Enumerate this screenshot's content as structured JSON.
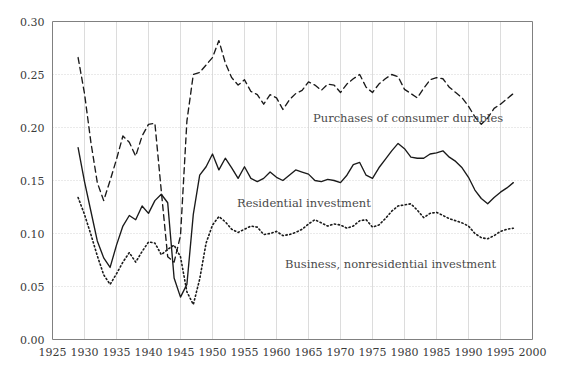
{
  "figure": {
    "background_color": "#ffffff",
    "line_color": "#1a1a1a",
    "grid_color": "#d8d8d8",
    "axis_color": "#808080"
  },
  "axes": {
    "x_tick_labels": [
      "1925",
      "1930",
      "1935",
      "1940",
      "1945",
      "1950",
      "1955",
      "1960",
      "1965",
      "1970",
      "1975",
      "1980",
      "1985",
      "1990",
      "1995",
      "2000"
    ],
    "y_tick_labels": [
      "0.00",
      "0.05",
      "0.10",
      "0.15",
      "0.20",
      "0.25",
      "0.30"
    ]
  },
  "annotations": {
    "durables": "Purchases of consumer durables",
    "residential": "Residential investment",
    "business": "Business, nonresidential investment"
  },
  "chart_data": {
    "type": "line",
    "title": "",
    "xlabel": "",
    "ylabel": "",
    "xlim": [
      1925,
      2000
    ],
    "ylim": [
      0.0,
      0.3
    ],
    "xticks": [
      1925,
      1930,
      1935,
      1940,
      1945,
      1950,
      1955,
      1960,
      1965,
      1970,
      1975,
      1980,
      1985,
      1990,
      1995,
      2000
    ],
    "yticks": [
      0.0,
      0.05,
      0.1,
      0.15,
      0.2,
      0.25,
      0.3
    ],
    "grid": true,
    "legend": "inline-annotations",
    "x": [
      1929,
      1930,
      1931,
      1932,
      1933,
      1934,
      1935,
      1936,
      1937,
      1938,
      1939,
      1940,
      1941,
      1942,
      1943,
      1944,
      1945,
      1946,
      1947,
      1948,
      1949,
      1950,
      1951,
      1952,
      1953,
      1954,
      1955,
      1956,
      1957,
      1958,
      1959,
      1960,
      1961,
      1962,
      1963,
      1964,
      1965,
      1966,
      1967,
      1968,
      1969,
      1970,
      1971,
      1972,
      1973,
      1974,
      1975,
      1976,
      1977,
      1978,
      1979,
      1980,
      1981,
      1982,
      1983,
      1984,
      1985,
      1986,
      1987,
      1988,
      1989,
      1990,
      1991,
      1992,
      1993,
      1994,
      1995,
      1996,
      1997
    ],
    "series": [
      {
        "name": "Purchases of consumer durables",
        "style": "dashed",
        "values": [
          0.266,
          0.232,
          0.186,
          0.148,
          0.131,
          0.15,
          0.17,
          0.192,
          0.186,
          0.173,
          0.192,
          0.203,
          0.204,
          0.14,
          0.078,
          0.073,
          0.098,
          0.206,
          0.25,
          0.252,
          0.259,
          0.266,
          0.282,
          0.261,
          0.247,
          0.24,
          0.245,
          0.234,
          0.231,
          0.222,
          0.231,
          0.228,
          0.217,
          0.226,
          0.232,
          0.235,
          0.243,
          0.24,
          0.235,
          0.241,
          0.24,
          0.233,
          0.241,
          0.246,
          0.25,
          0.238,
          0.233,
          0.241,
          0.246,
          0.25,
          0.248,
          0.236,
          0.232,
          0.228,
          0.237,
          0.245,
          0.247,
          0.246,
          0.238,
          0.233,
          0.228,
          0.22,
          0.21,
          0.203,
          0.209,
          0.218,
          0.222,
          0.227,
          0.232
        ]
      },
      {
        "name": "Residential investment",
        "style": "solid",
        "values": [
          0.181,
          0.149,
          0.121,
          0.093,
          0.077,
          0.068,
          0.089,
          0.107,
          0.117,
          0.113,
          0.126,
          0.119,
          0.131,
          0.137,
          0.129,
          0.058,
          0.04,
          0.052,
          0.118,
          0.155,
          0.163,
          0.175,
          0.16,
          0.171,
          0.162,
          0.152,
          0.163,
          0.152,
          0.149,
          0.152,
          0.158,
          0.153,
          0.15,
          0.155,
          0.16,
          0.158,
          0.156,
          0.15,
          0.149,
          0.151,
          0.15,
          0.148,
          0.155,
          0.165,
          0.167,
          0.155,
          0.152,
          0.162,
          0.17,
          0.178,
          0.185,
          0.18,
          0.172,
          0.171,
          0.171,
          0.175,
          0.176,
          0.178,
          0.172,
          0.168,
          0.162,
          0.153,
          0.141,
          0.133,
          0.128,
          0.134,
          0.139,
          0.143,
          0.148
        ]
      },
      {
        "name": "Business, nonresidential investment",
        "style": "dotted",
        "values": [
          0.134,
          0.118,
          0.099,
          0.079,
          0.061,
          0.052,
          0.062,
          0.073,
          0.082,
          0.073,
          0.083,
          0.092,
          0.091,
          0.08,
          0.085,
          0.089,
          0.078,
          0.045,
          0.033,
          0.057,
          0.091,
          0.108,
          0.116,
          0.111,
          0.104,
          0.101,
          0.104,
          0.107,
          0.106,
          0.099,
          0.1,
          0.102,
          0.098,
          0.099,
          0.101,
          0.104,
          0.109,
          0.113,
          0.11,
          0.107,
          0.109,
          0.108,
          0.105,
          0.107,
          0.112,
          0.113,
          0.106,
          0.108,
          0.114,
          0.121,
          0.126,
          0.127,
          0.128,
          0.122,
          0.115,
          0.119,
          0.12,
          0.117,
          0.114,
          0.112,
          0.11,
          0.107,
          0.1,
          0.096,
          0.095,
          0.098,
          0.102,
          0.104,
          0.105
        ]
      }
    ]
  }
}
